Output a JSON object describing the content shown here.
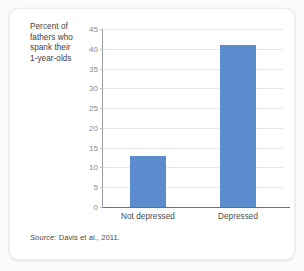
{
  "card": {
    "axis_label_lines": [
      "Percent of",
      "fathers who",
      "spank their",
      "1-year-olds"
    ],
    "source_prefix": "Source:",
    "source_text": "Davis et al., 2011."
  },
  "style": {
    "bar_color": "#5b8cce",
    "gridline_color": "#e6e6e6",
    "tick_text_color": "#8a8a8a",
    "axis_color": "#6e6e6e",
    "card_background": "#ffffff",
    "page_background": "#fbfbfb"
  },
  "chart_data": {
    "type": "bar",
    "title": "",
    "xlabel": "",
    "ylabel": "Percent of fathers who spank their 1-year-olds",
    "categories": [
      "Not depressed",
      "Depressed"
    ],
    "values": [
      13,
      41
    ],
    "ylim": [
      0,
      45
    ],
    "ytick_step": 5,
    "yticks": [
      0,
      5,
      10,
      15,
      20,
      25,
      30,
      35,
      40,
      45
    ],
    "ytick_labels": [
      "0",
      "5",
      "10",
      "15",
      "20",
      "25",
      "30",
      "35",
      "40",
      "45"
    ],
    "grid": true,
    "legend": false,
    "legend_position": "none",
    "annotations": [
      "Source: Davis et al., 2011."
    ]
  }
}
